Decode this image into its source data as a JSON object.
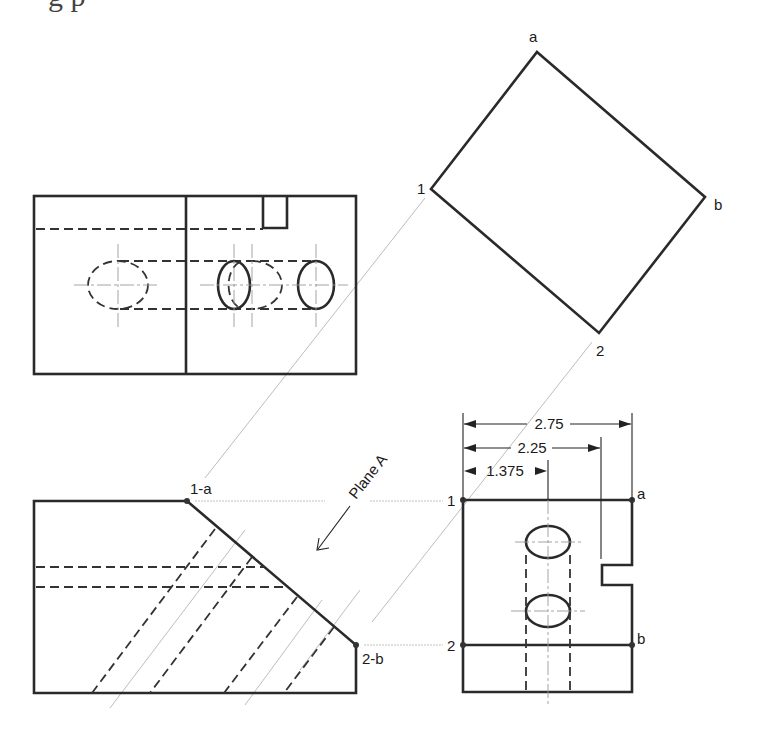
{
  "header_fragment": {
    "text": "g                 p"
  },
  "views": {
    "auxiliary_view": {
      "name": "auxiliary-view",
      "vertex_labels": {
        "a": "a",
        "b": "b",
        "one": "1",
        "two": "2"
      }
    },
    "top_view": {
      "name": "top-view"
    },
    "front_view": {
      "name": "front-view",
      "point_labels": {
        "one_a": "1-a",
        "two_b": "2-b"
      },
      "plane_label": "Plane A"
    },
    "side_view": {
      "name": "side-view",
      "point_labels": {
        "one": "1",
        "two": "2",
        "a": "a",
        "b": "b"
      },
      "dimensions": [
        {
          "label": "2.75",
          "value": 2.75
        },
        {
          "label": "2.25",
          "value": 2.25
        },
        {
          "label": "1.375",
          "value": 1.375
        }
      ]
    }
  },
  "colors": {
    "line": "#2a2a2a",
    "construction": "#b5b5b5",
    "background": "#ffffff"
  }
}
